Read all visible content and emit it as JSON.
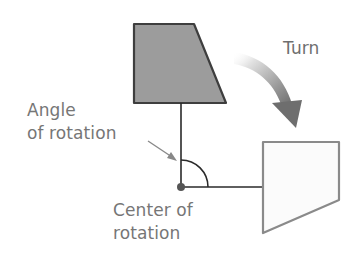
{
  "labels": {
    "turn": "Turn",
    "angle_line1": "Angle",
    "angle_line2": "of rotation",
    "center_line1": "Center of",
    "center_line2": "rotation"
  },
  "colors": {
    "original_shape_fill": "#9c9c9c",
    "original_shape_stroke": "#3e3e3e",
    "rotated_shape_fill": "#fbfbfb",
    "rotated_shape_stroke": "#8a8a8a",
    "line": "#2a2a2a",
    "text": "#767676",
    "arrow_dark": "#7a7a7a",
    "arrow_light": "#ffffff"
  },
  "shapes": {
    "original": "trapezoid",
    "rotated": "trapezoid rotated 90 degrees clockwise"
  },
  "angle": {
    "degrees": 90,
    "direction": "clockwise"
  }
}
